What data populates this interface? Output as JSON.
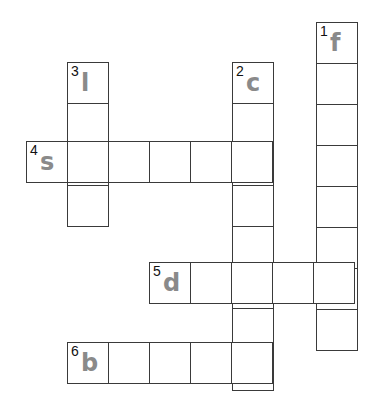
{
  "puzzle": {
    "type": "crossword",
    "cell_size": 41,
    "colors": {
      "border": "#3a3a3a",
      "hint_letter": "#8a8a8a",
      "number": "#111111"
    },
    "words": [
      {
        "number": "1",
        "first_letter": "f",
        "direction": "down",
        "x": 316,
        "y": 22,
        "length": 8
      },
      {
        "number": "2",
        "first_letter": "c",
        "direction": "down",
        "x": 232,
        "y": 62,
        "length": 8
      },
      {
        "number": "3",
        "first_letter": "l",
        "direction": "down",
        "x": 67,
        "y": 62,
        "length": 4
      },
      {
        "number": "4",
        "first_letter": "s",
        "direction": "across",
        "x": 26,
        "y": 141,
        "length": 6
      },
      {
        "number": "5",
        "first_letter": "d",
        "direction": "across",
        "x": 149,
        "y": 262,
        "length": 5
      },
      {
        "number": "6",
        "first_letter": "b",
        "direction": "across",
        "x": 67,
        "y": 342,
        "length": 5
      }
    ]
  }
}
